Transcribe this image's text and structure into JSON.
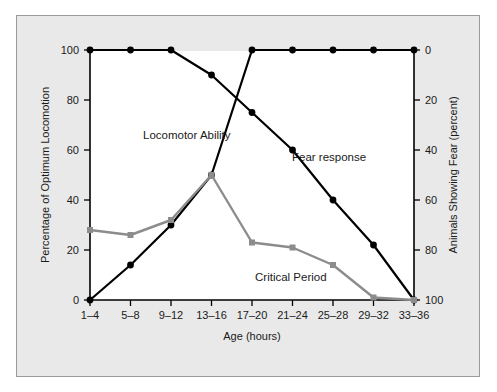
{
  "figure": {
    "panel_bg": "#e9e9e9",
    "plot_bg": "#ffffff",
    "border_color": "#9a9a9a"
  },
  "chart_data": {
    "type": "line",
    "title": "",
    "xlabel": "Age (hours)",
    "ylabel": "Percentage of Optimum Locomotion",
    "y2label": "Animals Showing Fear (percent)",
    "categories": [
      "1–4",
      "5–8",
      "9–12",
      "13–16",
      "17–20",
      "21–24",
      "25–28",
      "29–32",
      "33–36"
    ],
    "ylim": [
      0,
      100
    ],
    "yticks": [
      0,
      20,
      40,
      60,
      80,
      100
    ],
    "ytick_labels": [
      "0",
      "20",
      "40",
      "60",
      "80",
      "100"
    ],
    "y2lim": [
      100,
      0
    ],
    "y2ticks": [
      0,
      20,
      40,
      60,
      80,
      100
    ],
    "y2tick_labels": [
      "0",
      "20",
      "40",
      "60",
      "80",
      "100"
    ],
    "grid": false,
    "legend_position": "inline-annotations",
    "series": [
      {
        "name": "Locomotor Ability",
        "axis": "left",
        "color": "#000000",
        "marker": "circle",
        "values": [
          0,
          14,
          30,
          50,
          100,
          100,
          100,
          100,
          100
        ]
      },
      {
        "name": "Fear response",
        "axis": "right",
        "color": "#000000",
        "marker": "circle",
        "values": [
          0,
          0,
          0,
          10,
          25,
          40,
          60,
          78,
          100
        ],
        "left_axis_equivalent": [
          100,
          100,
          100,
          90,
          75,
          60,
          40,
          22,
          0
        ]
      },
      {
        "name": "Critical Period",
        "axis": "left",
        "color": "#8c8c8c",
        "marker": "square",
        "values": [
          28,
          26,
          32,
          50,
          23,
          21,
          14,
          1,
          0
        ]
      }
    ],
    "annotations": [
      {
        "text": "Locomotor Ability",
        "x_px": 126,
        "y_px": 123
      },
      {
        "text": "Fear response",
        "x_px": 275,
        "y_px": 145
      },
      {
        "text": "Critical Period",
        "x_px": 238,
        "y_px": 265
      }
    ]
  }
}
